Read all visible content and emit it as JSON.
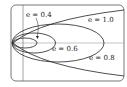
{
  "diagram": {
    "curves": [
      {
        "eccentricity": 0.4,
        "type": "ellipse",
        "label": "e = 0.4"
      },
      {
        "eccentricity": 0.6,
        "type": "ellipse",
        "label": "e = 0.6"
      },
      {
        "eccentricity": 0.8,
        "type": "ellipse",
        "label": "e = 0.8"
      },
      {
        "eccentricity": 1.0,
        "type": "parabola",
        "label": "e = 1.0"
      }
    ],
    "labels": {
      "e04": "e = 0.4",
      "e06": "e = 0.6",
      "e08": "e = 0.8",
      "e10": "e = 1.0"
    },
    "colors": {
      "stroke": "#222222",
      "axis": "#666666",
      "frame": "#555555"
    }
  }
}
